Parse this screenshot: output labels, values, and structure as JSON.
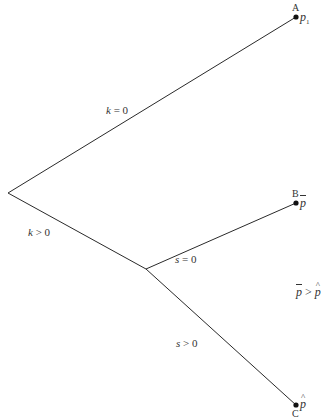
{
  "diagram": {
    "type": "decision-tree",
    "nodes": {
      "root": {
        "x": 8,
        "y": 193
      },
      "junction": {
        "x": 146,
        "y": 269
      },
      "A": {
        "letter": "A",
        "price": "p",
        "price_subscript": "1",
        "x": 296,
        "y": 17
      },
      "B": {
        "letter": "B",
        "price": "p",
        "price_mark": "bar",
        "x": 296,
        "y": 203
      },
      "C": {
        "letter": "C",
        "price": "p",
        "price_mark": "hat",
        "x": 296,
        "y": 405
      }
    },
    "branches": [
      {
        "from": "root",
        "to": "A",
        "label_var": "k",
        "label_op": "=",
        "label_val": "0"
      },
      {
        "from": "root",
        "to": "junction",
        "label_var": "k",
        "label_op": ">",
        "label_val": "0"
      },
      {
        "from": "junction",
        "to": "B",
        "label_var": "s",
        "label_op": "=",
        "label_val": "0"
      },
      {
        "from": "junction",
        "to": "C",
        "label_var": "s",
        "label_op": ">",
        "label_val": "0"
      }
    ],
    "note": {
      "lhs": "p",
      "op": ">",
      "rhs": "p"
    },
    "line_color": "#2a2a2a"
  }
}
